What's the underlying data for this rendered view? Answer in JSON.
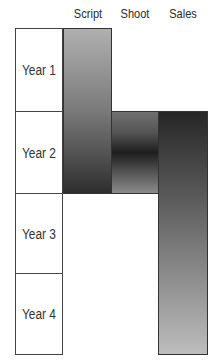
{
  "headers": [
    {
      "label": "Script",
      "x": 63
    },
    {
      "label": "Shoot",
      "x": 111
    },
    {
      "label": "Sales",
      "x": 158
    }
  ],
  "years": [
    {
      "label": "Year 1",
      "top": 28,
      "height": 84
    },
    {
      "label": "Year 2",
      "top": 111,
      "height": 83
    },
    {
      "label": "Year 3",
      "top": 193,
      "height": 81
    },
    {
      "label": "Year 4",
      "top": 273,
      "height": 82
    }
  ],
  "phases": [
    {
      "name": "Script",
      "start": "Year 1",
      "end": "Year 2",
      "gradient": [
        "#b0b0b0",
        "#2e2e2e"
      ]
    },
    {
      "name": "Shoot",
      "start": "Year 2",
      "end": "Year 2",
      "gradient": [
        "#707070",
        "#1e1e1e",
        "#8a8a8a"
      ]
    },
    {
      "name": "Sales",
      "start": "Year 2",
      "end": "Year 4",
      "gradient": [
        "#262626",
        "#bdbdbd"
      ]
    }
  ]
}
